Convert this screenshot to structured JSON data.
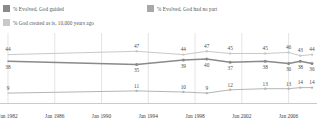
{
  "legend": {
    "items": [
      {
        "label": "% Evolved, God guided",
        "color": "#8a8a8a",
        "name": "legend-evolved-god-guided"
      },
      {
        "label": "% Evolved, God had no part",
        "color": "#a8a8a8",
        "name": "legend-evolved-god-no-part"
      },
      {
        "label": "% God created as is, 10,000 years ago",
        "color": "#c9c9c9",
        "name": "legend-god-created-as-is"
      }
    ]
  },
  "chart_data": {
    "type": "line",
    "title": "",
    "subtitle": "",
    "xlabel": "",
    "ylabel": "",
    "grid": true,
    "legend_position": "top",
    "ylim": [
      0,
      60
    ],
    "xlim": [
      1982,
      2008
    ],
    "xtick_labels": [
      "Jan 1982",
      "Jan 1986",
      "Jan 1990",
      "Jan 1994",
      "Jan 1998",
      "Jan 2002",
      "Jan 2006"
    ],
    "xtick_values": [
      1982,
      1986,
      1990,
      1994,
      1998,
      2002,
      2006
    ],
    "x": [
      1982,
      1993,
      1997,
      1999,
      2001,
      2004,
      2006,
      2007,
      2008
    ],
    "series": [
      {
        "name": "% God created as is, 10,000 years ago",
        "color": "#c9c9c9",
        "values": [
          44,
          47,
          44,
          47,
          45,
          45,
          46,
          43,
          44
        ],
        "labels": [
          "44",
          "47",
          "44",
          "47",
          "45",
          "45",
          "46",
          "43",
          "44"
        ]
      },
      {
        "name": "% Evolved, God guided",
        "color": "#8a8a8a",
        "values": [
          38,
          35,
          39,
          40,
          37,
          38,
          36,
          38,
          36
        ],
        "labels": [
          "38",
          "35",
          "39",
          "40",
          "37",
          "38",
          "36",
          "38",
          "36"
        ]
      },
      {
        "name": "% Evolved, God had no part",
        "color": "#b5b5b5",
        "values": [
          9,
          11,
          10,
          9,
          12,
          13,
          13,
          14,
          14
        ],
        "labels": [
          "9",
          "11",
          "10",
          "9",
          "12",
          "13",
          "13",
          "14",
          "14"
        ]
      }
    ]
  }
}
